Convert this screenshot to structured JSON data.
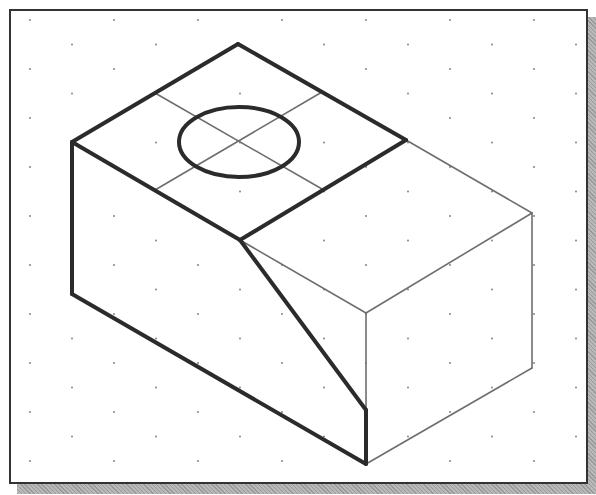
{
  "drawing": {
    "type": "isometric-sketch",
    "description": "Isometric view of a rectangular block with an inclined (sloped) left portion and a circular hole/feature on the top face, drawn on an isometric dot grid",
    "colors": {
      "background": "#ffffff",
      "frame": "#333333",
      "shadow": "#a8a8a8",
      "thick_lines": "#2b2b2b",
      "thin_lines": "#6e6e6e",
      "grid_dots": "#777777"
    },
    "grid": {
      "style": "isometric-dots",
      "dx": 84,
      "dy": 49,
      "origin": [
        30,
        20
      ]
    },
    "thick_edges": [
      [
        [
          72,
          142
        ],
        [
          238,
          44
        ]
      ],
      [
        [
          238,
          44
        ],
        [
          406,
          140
        ]
      ],
      [
        [
          406,
          140
        ],
        [
          240,
          240
        ]
      ],
      [
        [
          240,
          240
        ],
        [
          72,
          142
        ]
      ],
      [
        [
          72,
          142
        ],
        [
          72,
          294
        ]
      ],
      [
        [
          72,
          294
        ],
        [
          366,
          464
        ]
      ],
      [
        [
          366,
          464
        ],
        [
          366,
          410
        ]
      ],
      [
        [
          366,
          410
        ],
        [
          240,
          240
        ]
      ]
    ],
    "thin_edges": [
      [
        [
          406,
          140
        ],
        [
          532,
          213
        ]
      ],
      [
        [
          240,
          240
        ],
        [
          366,
          313
        ]
      ],
      [
        [
          366,
          313
        ],
        [
          532,
          213
        ]
      ],
      [
        [
          532,
          213
        ],
        [
          532,
          368
        ]
      ],
      [
        [
          532,
          368
        ],
        [
          366,
          464
        ]
      ],
      [
        [
          366,
          313
        ],
        [
          366,
          410
        ]
      ],
      [
        [
          155,
          93
        ],
        [
          322,
          189
        ]
      ],
      [
        [
          322,
          92
        ],
        [
          155,
          190
        ]
      ]
    ],
    "circle": {
      "cx": 239,
      "cy": 142,
      "rx": 60,
      "ry": 35
    }
  }
}
